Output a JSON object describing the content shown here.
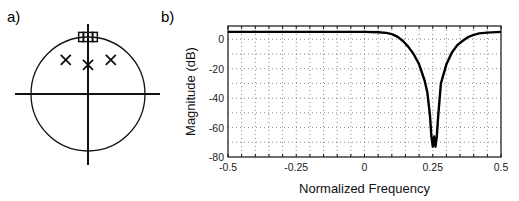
{
  "figure": {
    "panel_a_label": "a)",
    "panel_b_label": "b)"
  },
  "chart_data": [
    {
      "type": "scatter",
      "name": "pole-zero-plot",
      "title": "",
      "unit_circle": true,
      "xlim": [
        -1.3,
        1.3
      ],
      "ylim": [
        -1.3,
        1.3
      ],
      "poles": [
        {
          "re": -0.39,
          "im": 0.6
        },
        {
          "re": 0.0,
          "im": 0.51
        },
        {
          "re": 0.4,
          "im": 0.6
        }
      ],
      "zeros": [
        {
          "re": -0.12,
          "im": 1.0
        },
        {
          "re": -0.04,
          "im": 1.0
        },
        {
          "re": 0.04,
          "im": 1.0
        },
        {
          "re": 0.12,
          "im": 1.0
        }
      ],
      "markers": {
        "pole": "x",
        "zero": "square"
      }
    },
    {
      "type": "line",
      "name": "magnitude-response",
      "title": "",
      "xlabel": "Normalized Frequency",
      "ylabel": "Magnitude (dB)",
      "xlim": [
        -0.5,
        0.5
      ],
      "ylim": [
        -80,
        9
      ],
      "xticks": [
        -0.5,
        -0.25,
        0,
        0.25,
        0.5
      ],
      "xtick_labels": [
        "-0.5",
        "-0.25",
        "0",
        "0.25",
        "0.5"
      ],
      "yticks": [
        0,
        -20,
        -40,
        -60,
        -80
      ],
      "ytick_labels": [
        "0",
        "-20",
        "-40",
        "-60",
        "-80"
      ],
      "grid": true,
      "grid_x_step": 0.05,
      "grid_y_step": 10,
      "series": [
        {
          "name": "magnitude",
          "x": [
            -0.5,
            -0.3,
            -0.1,
            0.0,
            0.05,
            0.08,
            0.1,
            0.12,
            0.14,
            0.16,
            0.18,
            0.2,
            0.22,
            0.23,
            0.24,
            0.245,
            0.25,
            0.255,
            0.26,
            0.265,
            0.27,
            0.28,
            0.3,
            0.32,
            0.34,
            0.36,
            0.38,
            0.4,
            0.42,
            0.45,
            0.5
          ],
          "y": [
            5,
            5,
            5,
            5,
            4.8,
            4.3,
            3.5,
            1.8,
            -1,
            -5,
            -10,
            -17,
            -28,
            -36,
            -52,
            -66,
            -73,
            -66,
            -73,
            -66,
            -52,
            -30,
            -17,
            -9,
            -4,
            -1,
            1.5,
            3,
            4,
            4.5,
            5
          ]
        }
      ]
    }
  ]
}
